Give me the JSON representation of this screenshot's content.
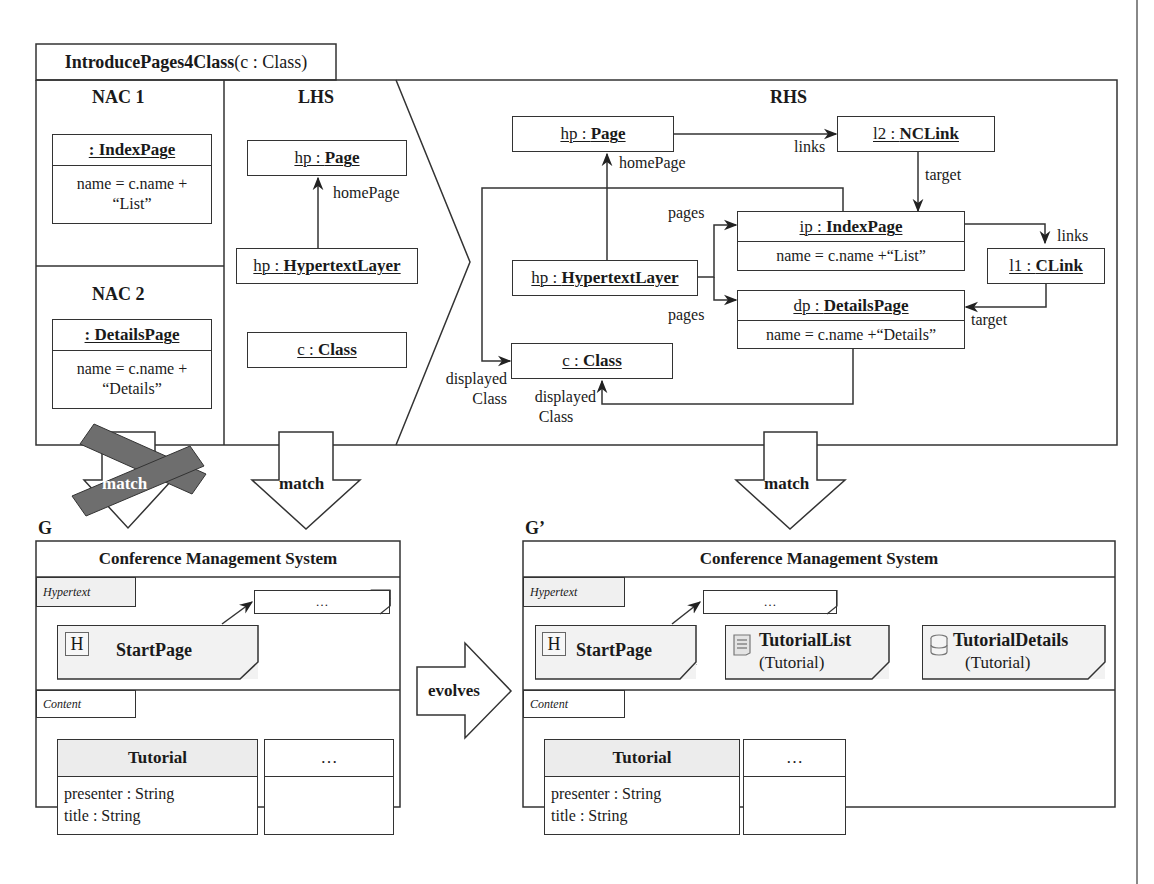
{
  "rule": {
    "name": "IntroducePages4Class",
    "params": "(c : Class)"
  },
  "nac1": {
    "title": "NAC 1",
    "object": {
      "name": ": IndexPage",
      "attr_line1": "name = c.name +",
      "attr_line2": "“List”"
    }
  },
  "nac2": {
    "title": "NAC 2",
    "object": {
      "name": ": DetailsPage",
      "attr_line1": "name = c.name +",
      "attr_line2": "“Details”"
    }
  },
  "lhs": {
    "title": "LHS",
    "page": {
      "id": "hp : ",
      "type": "Page"
    },
    "layer": {
      "id": "hp : ",
      "type": "HypertextLayer"
    },
    "cls": {
      "id": "c : ",
      "type": "Class"
    },
    "edge_homepage": "homePage"
  },
  "rhs": {
    "title": "RHS",
    "page": {
      "id": "hp : ",
      "type": "Page"
    },
    "nclink": {
      "id": "l2 : ",
      "type": "NCLink"
    },
    "indexpage": {
      "id": "ip : ",
      "type": "IndexPage",
      "attr": "name = c.name +“List”"
    },
    "clink": {
      "id": "l1 : ",
      "type": "CLink"
    },
    "layer": {
      "id": "hp : ",
      "type": "HypertextLayer"
    },
    "detailspage": {
      "id": "dp : ",
      "type": "DetailsPage",
      "attr": "name = c.name +“Details”"
    },
    "cls": {
      "id": "c : ",
      "type": "Class"
    },
    "edges": {
      "homepage": "homePage",
      "links_top": "links",
      "target_top": "target",
      "pages_top": "pages",
      "links_right": "links",
      "pages_bottom": "pages",
      "target_right": "target",
      "displayed1_a": "displayed",
      "displayed1_b": "Class",
      "displayed2_a": "displayed",
      "displayed2_b": "Class"
    }
  },
  "arrows": {
    "nac_match": "match",
    "lhs_match": "match",
    "rhs_match": "match",
    "evolves": "evolves"
  },
  "graph_g": {
    "label": "G",
    "title": "Conference Management System",
    "hypertext_tab": "Hypertext",
    "content_tab": "Content",
    "ellipsis_page": "…",
    "start_icon": "H",
    "start_page": "StartPage",
    "class": {
      "name": "Tutorial",
      "attrs": [
        "presenter : String",
        "title : String"
      ]
    },
    "ellipsis_class": "…"
  },
  "graph_g2": {
    "label": "G’",
    "title": "Conference Management System",
    "hypertext_tab": "Hypertext",
    "content_tab": "Content",
    "ellipsis_page": "…",
    "start_icon": "H",
    "start_page": "StartPage",
    "list_page": {
      "name": "TutorialList",
      "sub": "(Tutorial)"
    },
    "details_page": {
      "name": "TutorialDetails",
      "sub": "(Tutorial)"
    },
    "class": {
      "name": "Tutorial",
      "attrs": [
        "presenter : String",
        "title : String"
      ]
    },
    "ellipsis_class": "…"
  },
  "colors": {
    "line": "#333333",
    "cross": "#6e6e6e",
    "page_fill": "#f2f2f2",
    "class_head_fill": "#ececec"
  }
}
